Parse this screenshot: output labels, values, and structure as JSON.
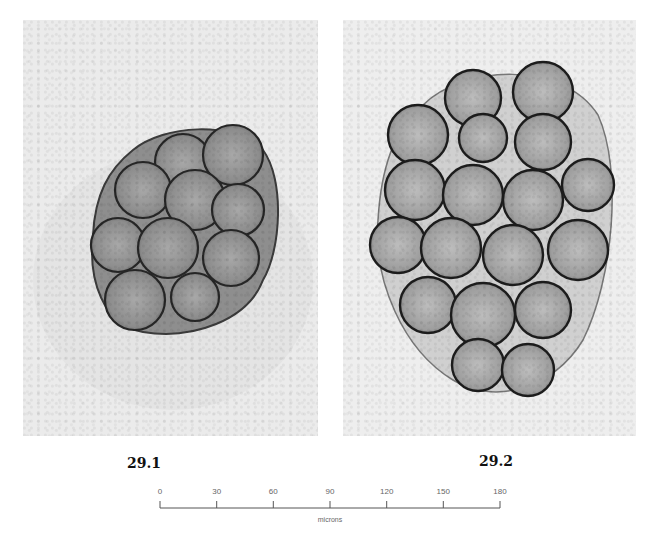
{
  "figure": {
    "panels": [
      {
        "id": "29.1",
        "caption": "29.1",
        "description": "micrograph of a compact rounded cluster of ~10 grains",
        "cell_count": 10
      },
      {
        "id": "29.2",
        "caption": "29.2",
        "description": "micrograph of an elongated cluster of ~18 grains",
        "cell_count": 18
      }
    ],
    "scale_bar": {
      "ticks": [
        "0",
        "30",
        "60",
        "90",
        "120",
        "150",
        "180"
      ],
      "unit_label": "microns"
    },
    "colors": {
      "background": "#ffffff",
      "panel_bg": "#ebebeb",
      "cell_outline": "#2a2a2a",
      "cell_fill": "#9a9a9a",
      "scale_color": "#555555"
    }
  }
}
